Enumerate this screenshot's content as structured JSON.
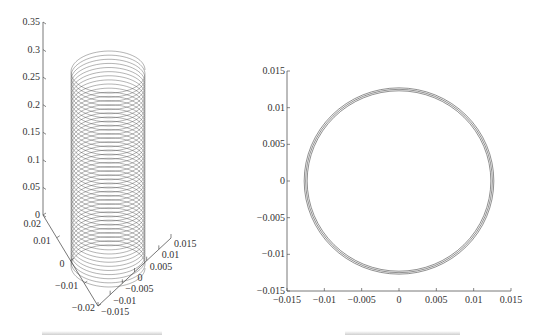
{
  "chart_data": [
    {
      "type": "scatter",
      "subtype": "3d-line",
      "title": "",
      "description": "Helical trajectory (spiral rising along vertical axis) viewed in 3D perspective",
      "axes": {
        "z": {
          "label": "",
          "range": [
            0,
            0.35
          ],
          "ticks": [
            0,
            0.05,
            0.1,
            0.15,
            0.2,
            0.25,
            0.3,
            0.35
          ],
          "tick_labels": [
            "0",
            "0.05",
            "0.1",
            "0.15",
            "0.2",
            "0.25",
            "0.3",
            "0.35"
          ]
        },
        "x": {
          "label": "",
          "range": [
            -0.02,
            0.02
          ],
          "ticks": [
            -0.02,
            -0.01,
            0,
            0.01,
            0.02
          ],
          "tick_labels": [
            "−0.02",
            "−0.01",
            "0",
            "0.01",
            "0.02"
          ]
        },
        "y": {
          "label": "",
          "range": [
            -0.015,
            0.015
          ],
          "ticks": [
            -0.015,
            -0.01,
            -0.005,
            0,
            0.005,
            0.01,
            0.015
          ],
          "tick_labels": [
            "−0.015",
            "−0.01",
            "−0.005",
            "0",
            "0.005",
            "0.01",
            "0.015"
          ]
        }
      },
      "series": [
        {
          "name": "helix",
          "radius": 0.0125,
          "z_start": 0.0,
          "z_end": 0.3,
          "turns": 48,
          "color": "#3a3a3a"
        }
      ],
      "grid": false,
      "legend": "none"
    },
    {
      "type": "line",
      "title": "",
      "description": "Projection of trajectory onto horizontal plane — near-circular closed loops",
      "xlabel": "",
      "ylabel": "",
      "xlim": [
        -0.015,
        0.015
      ],
      "ylim": [
        -0.015,
        0.015
      ],
      "xticks": [
        -0.015,
        -0.01,
        -0.005,
        0,
        0.005,
        0.01,
        0.015
      ],
      "xtick_labels": [
        "−0.015",
        "−0.01",
        "−0.005",
        "0",
        "0.005",
        "0.01",
        "0.015"
      ],
      "yticks": [
        -0.015,
        -0.01,
        -0.005,
        0,
        0.005,
        0.01,
        0.015
      ],
      "ytick_labels": [
        "−0.015",
        "−0.01",
        "−0.005",
        "0",
        "0.005",
        "0.01",
        "0.015"
      ],
      "series": [
        {
          "name": "outer-loop",
          "center": [
            0,
            0
          ],
          "radius": 0.0127,
          "color": "#444444"
        },
        {
          "name": "middle-loop",
          "center": [
            0,
            0
          ],
          "radius": 0.0125,
          "color": "#444444"
        },
        {
          "name": "inner-loop",
          "center": [
            0,
            0
          ],
          "radius": 0.0123,
          "color": "#444444"
        }
      ],
      "grid": false,
      "legend": "none"
    }
  ]
}
